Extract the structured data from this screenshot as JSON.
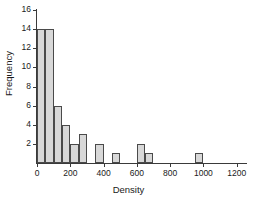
{
  "chart_data": {
    "type": "bar",
    "title": "",
    "xlabel": "Density",
    "ylabel": "Frequency",
    "xlim": [
      0,
      1250
    ],
    "ylim": [
      0,
      16
    ],
    "grid": false,
    "legend": null,
    "bin_width": 50,
    "xticks": [
      0,
      200,
      400,
      600,
      800,
      1000,
      1200
    ],
    "xtick_labels": [
      "0",
      "200",
      "400",
      "600",
      "800",
      "1000",
      "1200"
    ],
    "yticks": [
      2,
      4,
      6,
      8,
      10,
      12,
      14,
      16
    ],
    "ytick_labels": [
      "2",
      "4",
      "6",
      "8",
      "10",
      "12",
      "14",
      "16"
    ],
    "bins": [
      {
        "x0": 0,
        "x1": 50,
        "value": 14
      },
      {
        "x0": 50,
        "x1": 100,
        "value": 14
      },
      {
        "x0": 100,
        "x1": 150,
        "value": 6
      },
      {
        "x0": 150,
        "x1": 200,
        "value": 4
      },
      {
        "x0": 200,
        "x1": 250,
        "value": 2
      },
      {
        "x0": 250,
        "x1": 300,
        "value": 3
      },
      {
        "x0": 300,
        "x1": 350,
        "value": 0
      },
      {
        "x0": 350,
        "x1": 400,
        "value": 2
      },
      {
        "x0": 400,
        "x1": 450,
        "value": 0
      },
      {
        "x0": 450,
        "x1": 500,
        "value": 1
      },
      {
        "x0": 500,
        "x1": 550,
        "value": 0
      },
      {
        "x0": 550,
        "x1": 600,
        "value": 0
      },
      {
        "x0": 600,
        "x1": 650,
        "value": 2
      },
      {
        "x0": 650,
        "x1": 700,
        "value": 1
      },
      {
        "x0": 700,
        "x1": 750,
        "value": 0
      },
      {
        "x0": 750,
        "x1": 800,
        "value": 0
      },
      {
        "x0": 800,
        "x1": 850,
        "value": 0
      },
      {
        "x0": 850,
        "x1": 900,
        "value": 0
      },
      {
        "x0": 900,
        "x1": 950,
        "value": 0
      },
      {
        "x0": 950,
        "x1": 1000,
        "value": 1
      },
      {
        "x0": 1000,
        "x1": 1050,
        "value": 0
      },
      {
        "x0": 1050,
        "x1": 1100,
        "value": 0
      },
      {
        "x0": 1100,
        "x1": 1150,
        "value": 0
      },
      {
        "x0": 1150,
        "x1": 1200,
        "value": 0
      },
      {
        "x0": 1200,
        "x1": 1250,
        "value": 0
      }
    ],
    "colors": {
      "bar_fill": "#d8d8d8",
      "bar_edge": "#4a4a4a",
      "axis": "#3a3a3a",
      "text": "#1a1a1a",
      "background": "#ffffff"
    }
  }
}
